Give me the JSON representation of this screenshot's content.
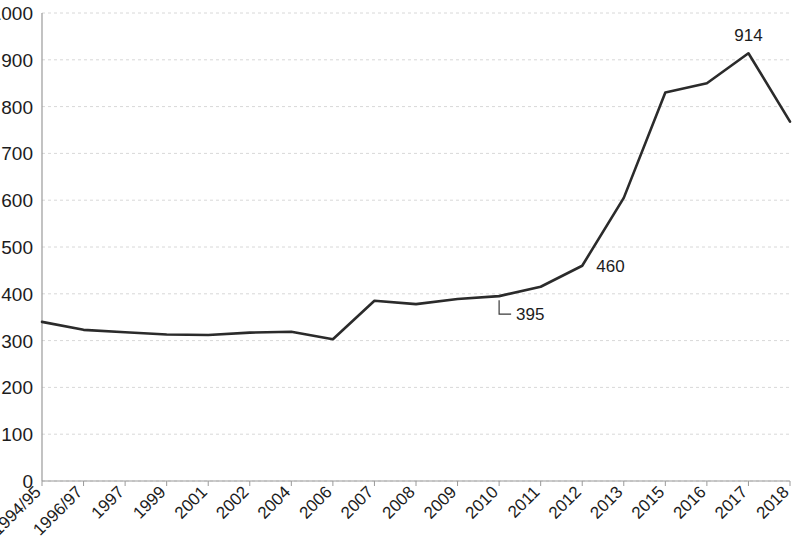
{
  "chart_data": {
    "type": "line",
    "title": "",
    "subtitle": "",
    "xlabel": "",
    "ylabel": "",
    "ylim": [
      0,
      1000
    ],
    "ytick_step": 100,
    "grid": true,
    "legend": "none",
    "line_color": "#2b2b2b",
    "grid_color": "#d8d8d8",
    "axis_color": "#9a9a9a",
    "categories": [
      "1994/95",
      "1996/97",
      "1997",
      "1999",
      "2001",
      "2002",
      "2004",
      "2006",
      "2007",
      "2008",
      "2009",
      "2010",
      "2011",
      "2012",
      "2013",
      "2015",
      "2016",
      "2017",
      "2018"
    ],
    "values": [
      340,
      323,
      318,
      313,
      312,
      317,
      319,
      303,
      385,
      378,
      389,
      395,
      415,
      460,
      605,
      830,
      850,
      914,
      768
    ],
    "yticks": [
      0,
      100,
      200,
      300,
      400,
      500,
      600,
      700,
      800,
      900,
      1000
    ],
    "ytick_labels": [
      "0",
      "100",
      "200",
      "300",
      "400",
      "500",
      "600",
      "700",
      "800",
      "900",
      "1000"
    ],
    "point_labels": [
      {
        "category": "2010",
        "value": 395,
        "text": "395",
        "has_leader": true
      },
      {
        "category": "2012",
        "value": 460,
        "text": "460",
        "has_leader": false
      },
      {
        "category": "2017",
        "value": 914,
        "text": "914",
        "has_leader": false
      }
    ]
  }
}
